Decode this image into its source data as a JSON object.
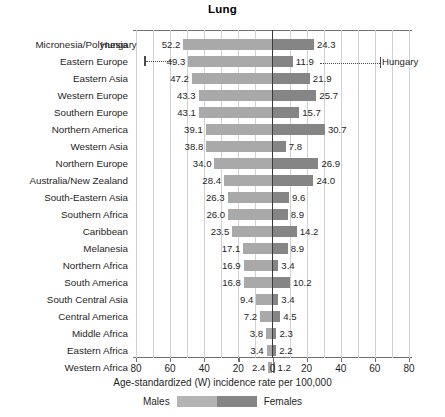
{
  "chart_data": {
    "type": "bar",
    "subtype": "diverging-population-pyramid",
    "title": "Lung",
    "xlabel": "Age-standardized (W) incidence rate per 100,000",
    "ylabel": "",
    "xlim": [
      -80,
      80
    ],
    "xticks": [
      -80,
      -60,
      -40,
      -20,
      0,
      20,
      40,
      60,
      80
    ],
    "xtick_labels": [
      "80",
      "60",
      "40",
      "20",
      "0",
      "20",
      "40",
      "60",
      "80"
    ],
    "grid": true,
    "legend_position": "bottom",
    "categories": [
      "Micronesia/Polynesia",
      "Eastern Europe",
      "Eastern Asia",
      "Western Europe",
      "Southern Europe",
      "Northern America",
      "Western Asia",
      "Northern Europe",
      "Australia/New Zealand",
      "South-Eastern Asia",
      "Southern Africa",
      "Caribbean",
      "Melanesia",
      "Northern Africa",
      "South America",
      "South Central Asia",
      "Central America",
      "Middle Africa",
      "Eastern Africa",
      "Western Africa"
    ],
    "series": [
      {
        "name": "Males",
        "color": "#a9a9a9",
        "side": "left",
        "values": [
          52.2,
          49.3,
          47.2,
          43.3,
          43.1,
          39.1,
          38.8,
          34.0,
          28.4,
          26.3,
          26.0,
          23.5,
          17.1,
          16.9,
          16.8,
          9.4,
          7.2,
          3.8,
          3.4,
          2.4
        ]
      },
      {
        "name": "Females",
        "color": "#858585",
        "side": "right",
        "values": [
          24.3,
          11.9,
          21.9,
          25.7,
          15.7,
          30.7,
          7.8,
          26.9,
          24.0,
          9.6,
          8.9,
          14.2,
          8.9,
          3.4,
          10.2,
          3.4,
          4.5,
          2.3,
          2.2,
          1.2
        ]
      }
    ],
    "annotations": [
      {
        "label": "Hungary",
        "row": 1,
        "side": "left",
        "value": 49.3,
        "text_label": "Hungary",
        "text_row": 0
      },
      {
        "label": "Hungary",
        "row": 1,
        "side": "right",
        "value": 11.9,
        "text_label": "Hungary",
        "text_row": 1
      }
    ]
  },
  "legend": {
    "left_label": "Males",
    "right_label": "Females",
    "left_color": "#b4b4b4",
    "right_color": "#858585"
  },
  "annotation_labels": {
    "left": "Hungary",
    "right": "Hungary"
  }
}
